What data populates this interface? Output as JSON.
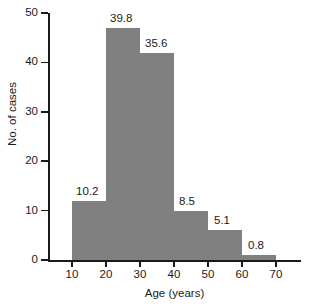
{
  "chart_data": {
    "type": "bar",
    "title": "",
    "xlabel": "Age (years)",
    "ylabel": "No. of cases",
    "xlim": [
      0,
      75
    ],
    "ylim": [
      0,
      50
    ],
    "grid": false,
    "legend": null,
    "bin_width": 10,
    "xticks": [
      "10",
      "20",
      "30",
      "40",
      "50",
      "60",
      "70"
    ],
    "xtick_values": [
      10,
      20,
      30,
      40,
      50,
      60,
      70
    ],
    "yticks": [
      "0",
      "10",
      "20",
      "30",
      "40",
      "50"
    ],
    "ytick_values": [
      0,
      10,
      20,
      30,
      40,
      50
    ],
    "bins": [
      {
        "range": "10-20",
        "x0": 10,
        "x1": 20,
        "count": 12,
        "label": "10.2"
      },
      {
        "range": "20-30",
        "x0": 20,
        "x1": 30,
        "count": 47,
        "label": "39.8"
      },
      {
        "range": "30-40",
        "x0": 30,
        "x1": 40,
        "count": 42,
        "label": "35.6"
      },
      {
        "range": "40-50",
        "x0": 40,
        "x1": 50,
        "count": 10,
        "label": "8.5"
      },
      {
        "range": "50-60",
        "x0": 50,
        "x1": 60,
        "count": 6,
        "label": "5.1"
      },
      {
        "range": "60-70",
        "x0": 60,
        "x1": 70,
        "count": 1,
        "label": "0.8"
      }
    ],
    "categories": [
      "10-20",
      "20-30",
      "30-40",
      "40-50",
      "50-60",
      "60-70"
    ],
    "values": [
      12,
      47,
      42,
      10,
      6,
      1
    ],
    "data_labels": [
      "10.2",
      "39.8",
      "35.6",
      "8.5",
      "5.1",
      "0.8"
    ],
    "data_label_units": "percent",
    "bar_color": "#808080",
    "axis_color": "#1a1a1a"
  }
}
